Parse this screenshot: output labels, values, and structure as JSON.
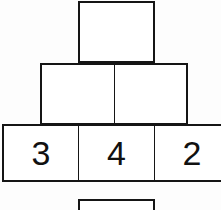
{
  "figure": {
    "background_color": "#fdfdfd",
    "stroke_color": "#151515",
    "fill_color": "#ffffff",
    "text_color": "#111111"
  },
  "blocks": {
    "apex": {
      "label": "",
      "row": 3,
      "position": 1
    },
    "middle_left": {
      "label": "",
      "row": 2,
      "position": 1
    },
    "middle_right": {
      "label": "",
      "row": 2,
      "position": 2
    },
    "base_left": {
      "label": "3",
      "row": 1,
      "position": 1
    },
    "base_center": {
      "label": "4",
      "row": 1,
      "position": 2
    },
    "base_right": {
      "label": "2",
      "row": 1,
      "position": 3
    },
    "below": {
      "label": "",
      "row": 0,
      "position": 1
    }
  },
  "chart_data": {
    "type": "diagram",
    "rows": [
      {
        "row": 0,
        "count": 1,
        "labels": [
          ""
        ],
        "clipped": true
      },
      {
        "row": 1,
        "count": 3,
        "labels": [
          "3",
          "4",
          "2"
        ],
        "clipped": true
      },
      {
        "row": 2,
        "count": 2,
        "labels": [
          "",
          ""
        ],
        "clipped": false
      },
      {
        "row": 3,
        "count": 1,
        "labels": [
          ""
        ],
        "clipped": false
      }
    ],
    "values": [
      3,
      4,
      2
    ],
    "categories": [
      "base-left",
      "base-center",
      "base-right"
    ],
    "xlabel": "",
    "ylabel": "",
    "grid": false,
    "legend": false
  }
}
